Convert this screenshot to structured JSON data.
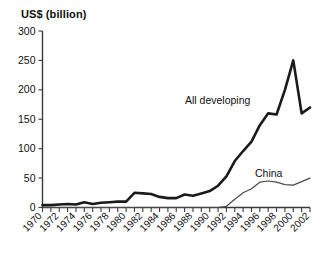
{
  "chart_data": {
    "type": "line",
    "title": "US$ (billion)",
    "xlabel": "",
    "ylabel": "US$ (billion)",
    "ylim": [
      0,
      300
    ],
    "xlim": [
      1970,
      2002
    ],
    "yticks": [
      0,
      50,
      100,
      150,
      200,
      250,
      300
    ],
    "xticks": [
      1970,
      1972,
      1974,
      1976,
      1978,
      1980,
      1982,
      1984,
      1986,
      1988,
      1990,
      1992,
      1994,
      1996,
      1998,
      2000,
      2002
    ],
    "grid": false,
    "legend_position": "inline-annotation",
    "x": [
      1970,
      1971,
      1972,
      1973,
      1974,
      1975,
      1976,
      1977,
      1978,
      1979,
      1980,
      1981,
      1982,
      1983,
      1984,
      1985,
      1986,
      1987,
      1988,
      1989,
      1990,
      1991,
      1992,
      1993,
      1994,
      1995,
      1996,
      1997,
      1998,
      1999,
      2000,
      2001,
      2002
    ],
    "series": [
      {
        "name": "All developing",
        "values": [
          4,
          4,
          5,
          6,
          5,
          9,
          6,
          8,
          9,
          10,
          10,
          25,
          24,
          23,
          18,
          16,
          16,
          22,
          20,
          24,
          28,
          37,
          53,
          79,
          96,
          112,
          140,
          160,
          158,
          200,
          250,
          160,
          170
        ],
        "style": "thick"
      },
      {
        "name": "China",
        "values": [
          0,
          0,
          0,
          0,
          0,
          0,
          0,
          0,
          0,
          0,
          0,
          0,
          0,
          0,
          0,
          0,
          0,
          0,
          0,
          0,
          0,
          0,
          2,
          14,
          25,
          32,
          43,
          45,
          43,
          39,
          38,
          44,
          50
        ],
        "style": "thin"
      }
    ],
    "annotations": [
      {
        "text": "All developing",
        "x_px": 185,
        "y_px": 104
      },
      {
        "text": "China",
        "x_px": 255,
        "y_px": 177
      }
    ]
  },
  "axes": {
    "y_tick_labels": [
      "300",
      "250",
      "200",
      "150",
      "100",
      "50",
      "0"
    ],
    "x_tick_labels": [
      "1970",
      "1972",
      "1974",
      "1976",
      "1978",
      "1980",
      "1982",
      "1984",
      "1986",
      "1988",
      "1990",
      "1992",
      "1994",
      "1996",
      "1998",
      "2000",
      "2002"
    ]
  },
  "colors": {
    "background": "#ffffff",
    "axis": "#3a3a3a",
    "all_developing": "#1a1a1a",
    "china": "#4a4a4a",
    "text": "#111111"
  }
}
